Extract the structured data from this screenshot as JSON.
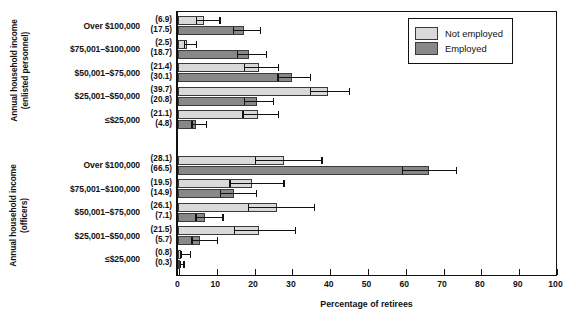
{
  "chart_data": {
    "type": "bar",
    "orientation": "horizontal",
    "title": "",
    "xlabel": "Percentage of retirees",
    "ylabel": "Annual household income",
    "xlim": [
      0,
      100
    ],
    "xticks": [
      0,
      10,
      20,
      30,
      40,
      50,
      60,
      70,
      80,
      90,
      100
    ],
    "grid": false,
    "legend_position": "top-right",
    "series": [
      {
        "name": "Not employed",
        "color": "#d9d9d9"
      },
      {
        "name": "Employed",
        "color": "#888888"
      }
    ],
    "panels": [
      {
        "axis_title": "Annual household income (enlisted personnel)",
        "categories": [
          {
            "label": "Over $100,000",
            "not_employed": 6.9,
            "employed": 17.5,
            "not_employed_err": [
              4.4,
              10.9
            ],
            "employed_err": [
              14.2,
              21.6
            ]
          },
          {
            "label": "$75,001–$100,000",
            "not_employed": 2.5,
            "employed": 18.7,
            "not_employed_err": [
              1.1,
              4.7
            ],
            "employed_err": [
              15.1,
              23.2
            ]
          },
          {
            "label": "$50,001–$75,000",
            "not_employed": 21.4,
            "employed": 30.1,
            "not_employed_err": [
              17.0,
              26.4
            ],
            "employed_err": [
              25.9,
              34.9
            ]
          },
          {
            "label": "$25,001–$50,000",
            "not_employed": 39.7,
            "employed": 20.8,
            "not_employed_err": [
              34.5,
              45.1
            ],
            "employed_err": [
              17.1,
              25.1
            ]
          },
          {
            "label": "≤$25,000",
            "not_employed": 21.1,
            "employed": 4.8,
            "not_employed_err": [
              16.6,
              26.4
            ],
            "employed_err": [
              3.1,
              7.3
            ]
          }
        ]
      },
      {
        "axis_title": "Annual household income (officers)",
        "categories": [
          {
            "label": "Over $100,000",
            "not_employed": 28.1,
            "employed": 66.5,
            "not_employed_err": [
              20.0,
              37.9
            ],
            "employed_err": [
              58.9,
              73.4
            ]
          },
          {
            "label": "$75,001–$100,000",
            "not_employed": 19.5,
            "employed": 14.9,
            "not_employed_err": [
              13.2,
              27.8
            ],
            "employed_err": [
              10.6,
              20.5
            ]
          },
          {
            "label": "$50,001–$75,000",
            "not_employed": 26.1,
            "employed": 7.1,
            "not_employed_err": [
              18.1,
              35.9
            ],
            "employed_err": [
              4.2,
              11.7
            ]
          },
          {
            "label": "$25,001–$50,000",
            "not_employed": 21.5,
            "employed": 5.7,
            "not_employed_err": [
              14.3,
              30.8
            ],
            "employed_err": [
              3.1,
              10.2
            ]
          },
          {
            "label": "≤$25,000",
            "not_employed": 0.8,
            "employed": 0.3,
            "not_employed_err": [
              0.2,
              3.1
            ],
            "employed_err": [
              0.1,
              1.4
            ]
          }
        ]
      }
    ]
  },
  "axis_titles": {
    "enlisted_line1": "Annual household income",
    "enlisted_line2": "(enlisted personnel)",
    "officers_line1": "Annual household income",
    "officers_line2": "(officers)",
    "xaxis": "Percentage of retirees"
  },
  "legend": {
    "not_employed": "Not employed",
    "employed": "Employed"
  },
  "xticks": [
    "0",
    "10",
    "20",
    "30",
    "40",
    "50",
    "60",
    "70",
    "80",
    "90",
    "100"
  ],
  "colors": {
    "not_employed": "#d9d9d9",
    "employed": "#888888",
    "axis": "#111111"
  }
}
